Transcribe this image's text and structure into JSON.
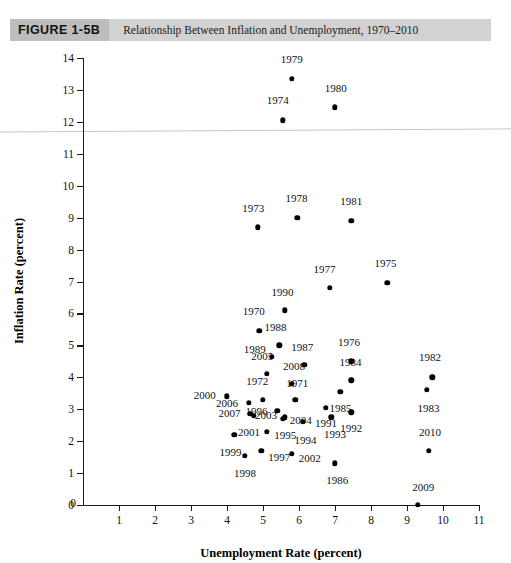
{
  "figure": {
    "tag": "FIGURE 1-5B",
    "caption": "Relationship Between Inflation and Unemployment, 1970–2010"
  },
  "chart_data": {
    "type": "scatter",
    "title": "Relationship Between Inflation and Unemployment, 1970–2010",
    "xlabel": "Unemployment Rate (percent)",
    "ylabel": "Inflation Rate (percent)",
    "xlim": [
      0,
      11
    ],
    "ylim": [
      0,
      14
    ],
    "xticks": [
      0,
      1,
      2,
      3,
      4,
      5,
      6,
      7,
      8,
      9,
      10,
      11
    ],
    "yticks": [
      0,
      1,
      2,
      3,
      4,
      5,
      6,
      7,
      8,
      9,
      10,
      11,
      12,
      13,
      14
    ],
    "grid": false,
    "legend": null,
    "point_label_key": "year",
    "points": [
      {
        "year": "1970",
        "x": 4.9,
        "y": 5.45,
        "lx": -0.16,
        "ly": 0.62
      },
      {
        "year": "1971",
        "x": 5.9,
        "y": 3.3,
        "lx": 0.05,
        "ly": 0.52
      },
      {
        "year": "1972",
        "x": 5.0,
        "y": 3.3,
        "lx": -0.16,
        "ly": 0.58
      },
      {
        "year": "1973",
        "x": 4.85,
        "y": 8.7,
        "lx": -0.12,
        "ly": 0.6
      },
      {
        "year": "1974",
        "x": 5.55,
        "y": 12.05,
        "lx": -0.14,
        "ly": 0.62
      },
      {
        "year": "1975",
        "x": 8.45,
        "y": 6.95,
        "lx": -0.05,
        "ly": 0.62
      },
      {
        "year": "1976",
        "x": 7.45,
        "y": 4.5,
        "lx": -0.06,
        "ly": 0.6
      },
      {
        "year": "1977",
        "x": 6.85,
        "y": 6.8,
        "lx": -0.14,
        "ly": 0.6
      },
      {
        "year": "1978",
        "x": 5.95,
        "y": 9.0,
        "lx": -0.02,
        "ly": 0.6
      },
      {
        "year": "1979",
        "x": 5.8,
        "y": 13.35,
        "lx": 0.0,
        "ly": 0.62
      },
      {
        "year": "1980",
        "x": 7.0,
        "y": 12.45,
        "lx": 0.02,
        "ly": 0.62
      },
      {
        "year": "1981",
        "x": 7.45,
        "y": 8.9,
        "lx": 0.0,
        "ly": 0.62
      },
      {
        "year": "1982",
        "x": 9.7,
        "y": 4.0,
        "lx": -0.06,
        "ly": 0.62
      },
      {
        "year": "1983",
        "x": 9.55,
        "y": 3.6,
        "lx": 0.05,
        "ly": -0.55
      },
      {
        "year": "1984",
        "x": 7.45,
        "y": 3.9,
        "lx": -0.02,
        "ly": 0.58
      },
      {
        "year": "1985",
        "x": 7.15,
        "y": 3.55,
        "lx": 0.0,
        "ly": -0.5
      },
      {
        "year": "1986",
        "x": 7.0,
        "y": 1.3,
        "lx": 0.06,
        "ly": -0.52
      },
      {
        "year": "1987",
        "x": 6.15,
        "y": 4.4,
        "lx": -0.06,
        "ly": 0.56
      },
      {
        "year": "1988",
        "x": 5.45,
        "y": 5.0,
        "lx": -0.1,
        "ly": 0.56
      },
      {
        "year": "1989",
        "x": 5.25,
        "y": 4.65,
        "lx": -0.48,
        "ly": 0.25
      },
      {
        "year": "1990",
        "x": 5.6,
        "y": 6.1,
        "lx": -0.06,
        "ly": 0.58
      },
      {
        "year": "1991",
        "x": 6.75,
        "y": 3.05,
        "lx": 0.0,
        "ly": -0.48
      },
      {
        "year": "1992",
        "x": 7.45,
        "y": 2.9,
        "lx": 0.0,
        "ly": -0.48
      },
      {
        "year": "1993",
        "x": 6.9,
        "y": 2.75,
        "lx": 0.1,
        "ly": -0.52
      },
      {
        "year": "1994",
        "x": 6.1,
        "y": 2.6,
        "lx": 0.08,
        "ly": -0.55
      },
      {
        "year": "1995",
        "x": 5.6,
        "y": 2.75,
        "lx": 0.02,
        "ly": -0.55
      },
      {
        "year": "1996",
        "x": 5.4,
        "y": 2.95,
        "lx": -0.58,
        "ly": -0.02
      },
      {
        "year": "1997",
        "x": 4.95,
        "y": 1.7,
        "lx": 0.5,
        "ly": -0.2
      },
      {
        "year": "1998",
        "x": 4.5,
        "y": 1.55,
        "lx": 0.0,
        "ly": -0.55
      },
      {
        "year": "1999",
        "x": 4.2,
        "y": 2.2,
        "lx": -0.1,
        "ly": -0.55
      },
      {
        "year": "2000",
        "x": 4.0,
        "y": 3.4,
        "lx": -0.62,
        "ly": 0.06
      },
      {
        "year": "2001",
        "x": 4.75,
        "y": 2.8,
        "lx": -0.14,
        "ly": -0.5
      },
      {
        "year": "2002",
        "x": 5.8,
        "y": 1.6,
        "lx": 0.5,
        "ly": -0.12
      },
      {
        "year": "2003",
        "x": 5.1,
        "y": 2.3,
        "lx": -0.02,
        "ly": 0.52
      },
      {
        "year": "2004",
        "x": 5.55,
        "y": 2.7,
        "lx": 0.5,
        "ly": -0.05
      },
      {
        "year": "2005",
        "x": 5.1,
        "y": 4.1,
        "lx": -0.12,
        "ly": 0.56
      },
      {
        "year": "2006",
        "x": 4.6,
        "y": 3.2,
        "lx": -0.6,
        "ly": 0.0
      },
      {
        "year": "2007",
        "x": 4.65,
        "y": 2.85,
        "lx": -0.58,
        "ly": 0.02
      },
      {
        "year": "2008",
        "x": 5.8,
        "y": 3.8,
        "lx": 0.06,
        "ly": 0.56
      },
      {
        "year": "2009",
        "x": 9.3,
        "y": 0.0,
        "lx": 0.15,
        "ly": 0.56
      },
      {
        "year": "2010",
        "x": 9.6,
        "y": 1.7,
        "lx": 0.04,
        "ly": 0.58
      }
    ]
  }
}
